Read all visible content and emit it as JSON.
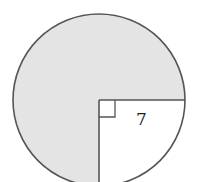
{
  "diagram": {
    "type": "circle-with-removed-quarter-sector",
    "shaded_region": "three-quarters of circle",
    "unshaded_region": "bottom-right quarter sector",
    "radius_label": "7",
    "right_angle_marker": true,
    "colors": {
      "fill": "#e4e4e4",
      "stroke": "#555555",
      "background": "#ffffff"
    }
  }
}
